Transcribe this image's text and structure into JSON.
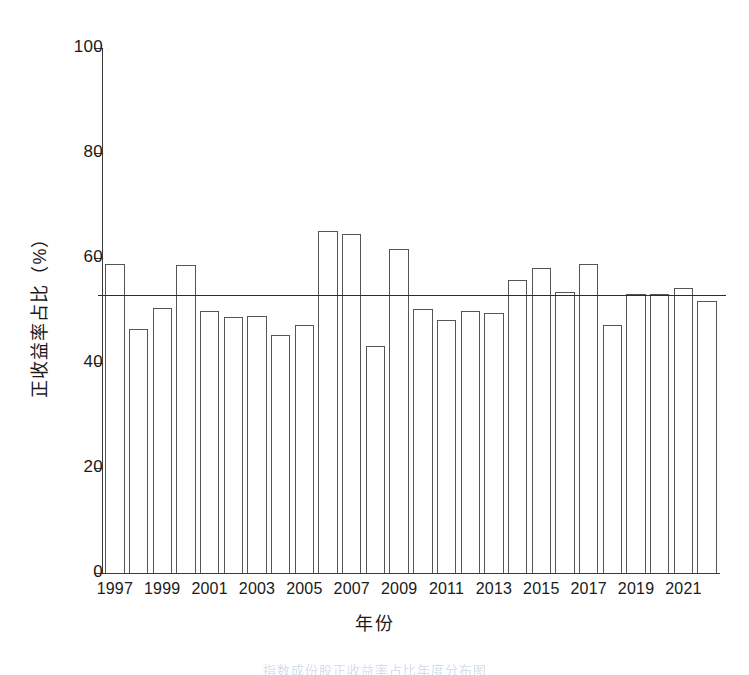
{
  "chart_data": {
    "type": "bar",
    "title": "",
    "subtitle": "",
    "xlabel": "年份",
    "ylabel": "正收益率占比（%）",
    "ylim": [
      0,
      100
    ],
    "ytick_labels": [
      "0",
      "20",
      "40",
      "60",
      "80",
      "100"
    ],
    "ytick_values": [
      0,
      20,
      40,
      60,
      80,
      100
    ],
    "xtick_labels": [
      "1997",
      "1999",
      "2001",
      "2003",
      "2005",
      "2007",
      "2009",
      "2011",
      "2013",
      "2015",
      "2017",
      "2019",
      "2021"
    ],
    "grid": false,
    "legend": "none",
    "categories": [
      "1997",
      "1998",
      "1999",
      "2000",
      "2001",
      "2002",
      "2003",
      "2004",
      "2005",
      "2006",
      "2007",
      "2008",
      "2009",
      "2010",
      "2011",
      "2012",
      "2013",
      "2014",
      "2015",
      "2016",
      "2017",
      "2018",
      "2019",
      "2020",
      "2021",
      "2022"
    ],
    "values": [
      58.8,
      46.4,
      50.5,
      58.7,
      50.0,
      48.8,
      49.0,
      45.3,
      47.2,
      65.2,
      64.5,
      43.3,
      61.7,
      50.3,
      48.2,
      49.9,
      49.5,
      55.9,
      58.1,
      53.6,
      58.9,
      47.2,
      53.2,
      53.2,
      54.3,
      51.8
    ],
    "annotations": [
      {
        "name": "mean-reference-line",
        "kind": "horizontal-line",
        "value": 52.9,
        "label": ""
      }
    ]
  },
  "caption": {
    "text": "指数成份股正收益率占比年度分布图"
  }
}
